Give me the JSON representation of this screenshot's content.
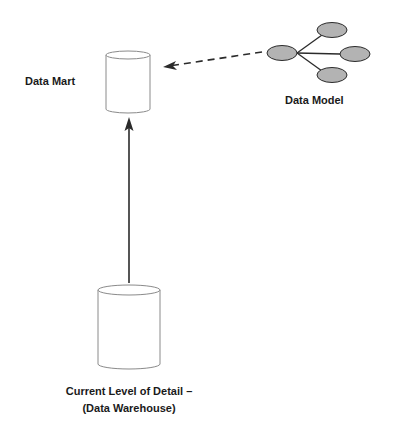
{
  "diagram": {
    "type": "architecture-flow",
    "nodes": {
      "data_mart": {
        "label": "Data Mart",
        "shape": "cylinder"
      },
      "data_model": {
        "label": "Data Model",
        "shape": "entity-star",
        "entity_count": 4
      },
      "data_warehouse": {
        "label_line1": "Current Level of Detail –",
        "label_line2": "(Data Warehouse)",
        "shape": "cylinder"
      }
    },
    "edges": [
      {
        "from": "data_warehouse",
        "to": "data_mart",
        "style": "solid"
      },
      {
        "from": "data_model",
        "to": "data_mart",
        "style": "dashed"
      }
    ],
    "colors": {
      "stroke": "#2b2b2b",
      "cylinder_stroke": "#8a8a8a",
      "entity_fill": "#b3b3b3",
      "text": "#1a1a1a",
      "background": "#ffffff"
    }
  }
}
